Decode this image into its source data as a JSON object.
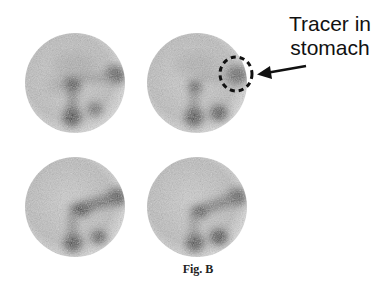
{
  "figure": {
    "caption": "Fig. B",
    "annotation": {
      "line1": "Tracer in",
      "line2": "stomach",
      "target_panel": "top-right",
      "marker": "dashed-circle"
    },
    "panels": [
      {
        "id": "top-left",
        "position": "row 1, column 1"
      },
      {
        "id": "top-right",
        "position": "row 1, column 2",
        "highlight": "tracer in stomach"
      },
      {
        "id": "bottom-left",
        "position": "row 2, column 1"
      },
      {
        "id": "bottom-right",
        "position": "row 2, column 2"
      }
    ],
    "colors": {
      "background": "#ffffff",
      "scan_background": "#d4d4d4",
      "scan_uptake": "#1a1a1a",
      "annotation": "#111111"
    }
  }
}
